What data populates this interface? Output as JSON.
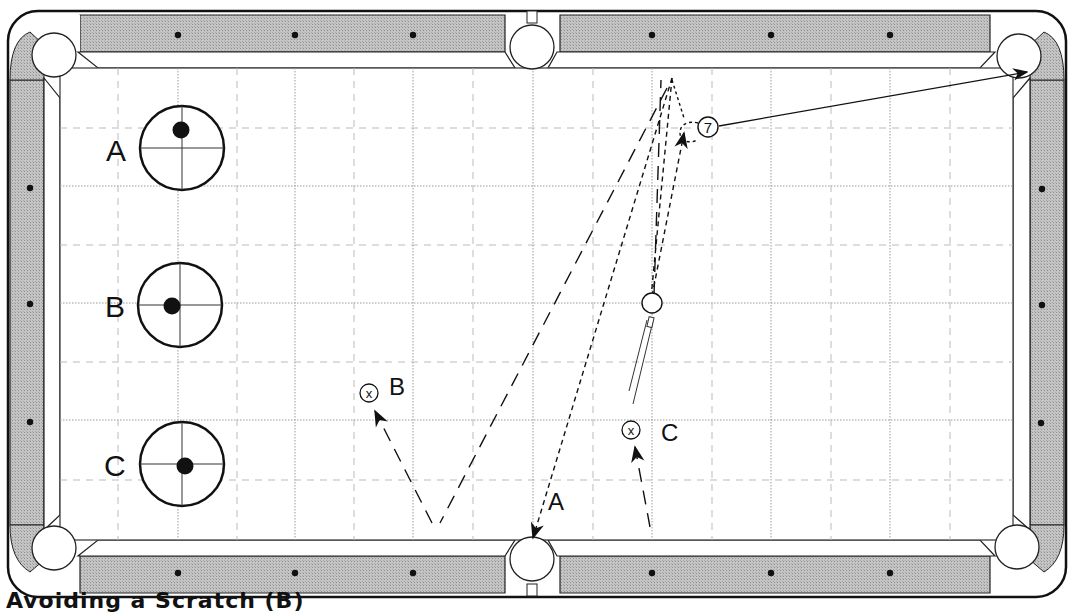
{
  "diagram": {
    "type": "billiards-table-diagram",
    "caption": "Avoiding a Scratch (B)",
    "colors": {
      "rail": "#bdbdbd",
      "cloth": "#ffffff",
      "outline": "#111111",
      "grid": "#9a9a9a",
      "diamond": "#111111"
    },
    "cue_tip_diagrams": [
      {
        "label": "A",
        "tip_position": "top center (follow)"
      },
      {
        "label": "B",
        "tip_position": "left center (left english)"
      },
      {
        "label": "C",
        "tip_position": "slightly below/right of center"
      }
    ],
    "balls": [
      {
        "name": "cue-ball",
        "label": ""
      },
      {
        "name": "object-ball-7",
        "label": "7"
      }
    ],
    "shot_paths": [
      {
        "label": "A",
        "description": "cue ball follows to top rail and returns toward the bottom side pocket (scratch)"
      },
      {
        "label": "B",
        "description": "cue ball rebounds off top rail to bottom rail, then up to position marker B"
      },
      {
        "label": "C",
        "description": "cue ball comes off top rail and stops at position marker C"
      }
    ],
    "position_markers": [
      {
        "label": "B",
        "symbol": "⊗"
      },
      {
        "label": "C",
        "symbol": "⊗"
      }
    ],
    "object_ball_path": "7 ball travels to the upper-right corner pocket",
    "pockets": 6,
    "diamonds_per_long_rail": 6,
    "diamonds_per_short_rail": 3
  }
}
